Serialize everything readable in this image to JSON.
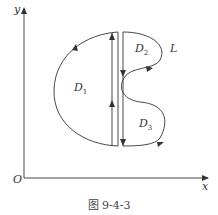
{
  "figure": {
    "caption": "图 9-4-3",
    "labels": {
      "y_axis": "y",
      "x_axis": "x",
      "origin": "O",
      "curve": "L",
      "region1": "D",
      "region1_sub": "1",
      "region2": "D",
      "region2_sub": "2",
      "region3": "D",
      "region3_sub": "3"
    },
    "stroke_color": "#333333"
  }
}
